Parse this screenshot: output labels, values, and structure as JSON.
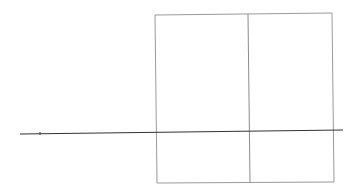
{
  "diagram": {
    "canvas": {
      "width": 356,
      "height": 185,
      "background": "#ffffff"
    },
    "colors": {
      "frame": "#9a9a9a",
      "axis": "#333333"
    },
    "frame": {
      "x1": 155,
      "y1": 14,
      "x2": 333,
      "y2": 182
    },
    "divider": {
      "x_top": 249,
      "x_bottom": 250
    },
    "axis_line": {
      "x1": 20,
      "y1": 134,
      "x2": 343,
      "y2": 130
    },
    "tick": {
      "x": 40,
      "y": 134
    }
  }
}
